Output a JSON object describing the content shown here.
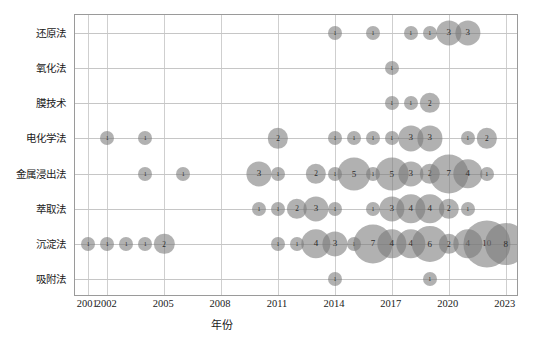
{
  "chart_data": {
    "type": "scatter",
    "subtype": "bubble",
    "title": "",
    "xlabel": "年份",
    "ylabel": "",
    "xlim": [
      2000.3,
      2023.7
    ],
    "xticks": [
      2001,
      2002,
      2005,
      2008,
      2011,
      2014,
      2017,
      2020,
      2023
    ],
    "xticklabels": [
      "2001",
      "2002",
      "2005",
      "2008",
      "2011",
      "2014",
      "2017",
      "2020",
      "2023"
    ],
    "categories": [
      "还原法",
      "氧化法",
      "膜技术",
      "电化学法",
      "金属浸出法",
      "萃取法",
      "沉淀法",
      "吸附法"
    ],
    "grid": true,
    "legend": false,
    "bubble_color": "#787878",
    "bubble_opacity": 0.58,
    "value_label_color": "#2b2b2b",
    "series": [
      {
        "name": "还原法",
        "points": [
          {
            "x": 2014,
            "v": 1
          },
          {
            "x": 2016,
            "v": 1
          },
          {
            "x": 2018,
            "v": 1
          },
          {
            "x": 2019,
            "v": 1
          },
          {
            "x": 2020,
            "v": 3
          },
          {
            "x": 2021,
            "v": 3
          }
        ]
      },
      {
        "name": "氧化法",
        "points": [
          {
            "x": 2017,
            "v": 1
          }
        ]
      },
      {
        "name": "膜技术",
        "points": [
          {
            "x": 2017,
            "v": 1
          },
          {
            "x": 2018,
            "v": 1
          },
          {
            "x": 2019,
            "v": 2
          }
        ]
      },
      {
        "name": "电化学法",
        "points": [
          {
            "x": 2002,
            "v": 1
          },
          {
            "x": 2004,
            "v": 1
          },
          {
            "x": 2011,
            "v": 2
          },
          {
            "x": 2014,
            "v": 1
          },
          {
            "x": 2015,
            "v": 1
          },
          {
            "x": 2016,
            "v": 1
          },
          {
            "x": 2017,
            "v": 1
          },
          {
            "x": 2018,
            "v": 3
          },
          {
            "x": 2019,
            "v": 3
          },
          {
            "x": 2021,
            "v": 1
          },
          {
            "x": 2022,
            "v": 2
          }
        ]
      },
      {
        "name": "金属浸出法",
        "points": [
          {
            "x": 2004,
            "v": 1
          },
          {
            "x": 2006,
            "v": 1
          },
          {
            "x": 2010,
            "v": 3
          },
          {
            "x": 2011,
            "v": 1
          },
          {
            "x": 2013,
            "v": 2
          },
          {
            "x": 2014,
            "v": 1
          },
          {
            "x": 2015,
            "v": 5
          },
          {
            "x": 2016,
            "v": 1
          },
          {
            "x": 2017,
            "v": 5
          },
          {
            "x": 2018,
            "v": 3
          },
          {
            "x": 2019,
            "v": 2
          },
          {
            "x": 2020,
            "v": 7
          },
          {
            "x": 2021,
            "v": 4
          },
          {
            "x": 2022,
            "v": 1
          }
        ]
      },
      {
        "name": "萃取法",
        "points": [
          {
            "x": 2010,
            "v": 1
          },
          {
            "x": 2011,
            "v": 1
          },
          {
            "x": 2012,
            "v": 2
          },
          {
            "x": 2013,
            "v": 3
          },
          {
            "x": 2014,
            "v": 1
          },
          {
            "x": 2016,
            "v": 1
          },
          {
            "x": 2017,
            "v": 3
          },
          {
            "x": 2018,
            "v": 4
          },
          {
            "x": 2019,
            "v": 4
          },
          {
            "x": 2020,
            "v": 2
          },
          {
            "x": 2021,
            "v": 1
          }
        ]
      },
      {
        "name": "沉淀法",
        "points": [
          {
            "x": 2001,
            "v": 1
          },
          {
            "x": 2002,
            "v": 1
          },
          {
            "x": 2003,
            "v": 1
          },
          {
            "x": 2004,
            "v": 1
          },
          {
            "x": 2005,
            "v": 2
          },
          {
            "x": 2011,
            "v": 1
          },
          {
            "x": 2012,
            "v": 1
          },
          {
            "x": 2013,
            "v": 4
          },
          {
            "x": 2014,
            "v": 3
          },
          {
            "x": 2015,
            "v": 1
          },
          {
            "x": 2016,
            "v": 7
          },
          {
            "x": 2017,
            "v": 4
          },
          {
            "x": 2018,
            "v": 4
          },
          {
            "x": 2019,
            "v": 6
          },
          {
            "x": 2020,
            "v": 2
          },
          {
            "x": 2021,
            "v": 4
          },
          {
            "x": 2022,
            "v": 10
          },
          {
            "x": 2023,
            "v": 8
          }
        ]
      },
      {
        "name": "吸附法",
        "points": [
          {
            "x": 2014,
            "v": 1
          },
          {
            "x": 2019,
            "v": 1
          }
        ]
      }
    ]
  }
}
